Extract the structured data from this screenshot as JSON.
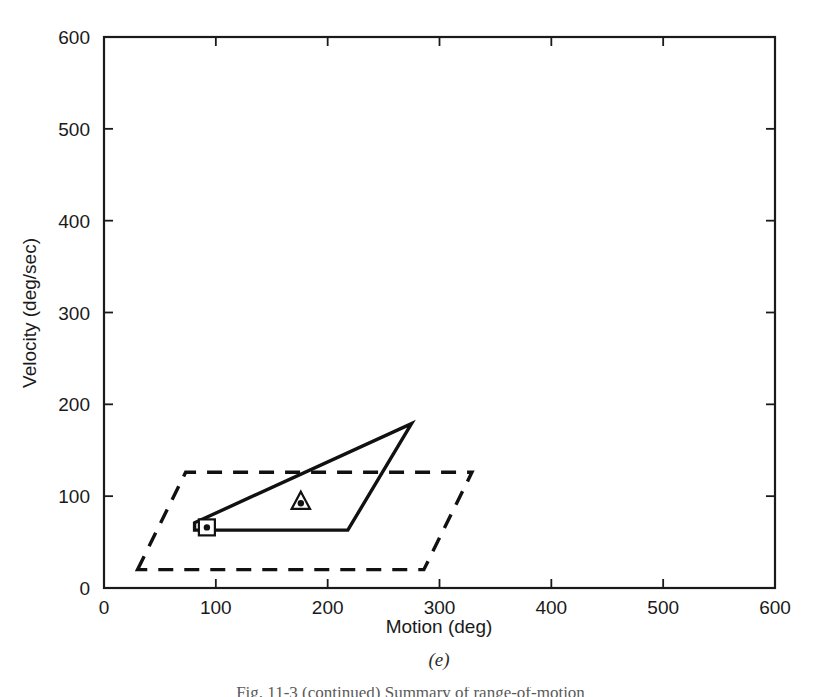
{
  "figure": {
    "subcaption": "(e)",
    "partial_caption": "Fig. 11-3 (continued) Summary of range-of-motion",
    "line_color": "#111111",
    "text_color": "#1a1a1a"
  },
  "chart_data": {
    "type": "line",
    "title": "",
    "subtitle": "(e)",
    "xlabel": "Motion (deg)",
    "ylabel": "Velocity (deg/sec)",
    "xlim": [
      0,
      600
    ],
    "ylim": [
      0,
      600
    ],
    "xticks": [
      0,
      100,
      200,
      300,
      400,
      500,
      600
    ],
    "yticks": [
      0,
      100,
      200,
      300,
      400,
      500,
      600
    ],
    "xticklabels": [
      "0",
      "100",
      "200",
      "300",
      "400",
      "500",
      "600"
    ],
    "yticklabels": [
      "0",
      "100",
      "200",
      "300",
      "400",
      "500",
      "600"
    ],
    "grid": false,
    "legend": null,
    "series": [
      {
        "name": "solid-envelope",
        "style": "solid",
        "closed": true,
        "points": [
          {
            "x": 81,
            "y": 71
          },
          {
            "x": 275,
            "y": 179
          },
          {
            "x": 218,
            "y": 63
          },
          {
            "x": 81,
            "y": 63
          }
        ]
      },
      {
        "name": "dashed-envelope",
        "style": "dashed",
        "closed": true,
        "points": [
          {
            "x": 30,
            "y": 20
          },
          {
            "x": 73,
            "y": 126
          },
          {
            "x": 329,
            "y": 126
          },
          {
            "x": 286,
            "y": 20
          }
        ]
      }
    ],
    "markers": [
      {
        "name": "square-dot-marker",
        "shape": "square",
        "x": 92,
        "y": 66
      },
      {
        "name": "triangle-dot-marker",
        "shape": "triangle",
        "x": 176,
        "y": 94
      }
    ]
  },
  "axes": {
    "x_title": "Motion (deg)",
    "y_title": "Velocity (deg/sec)"
  }
}
